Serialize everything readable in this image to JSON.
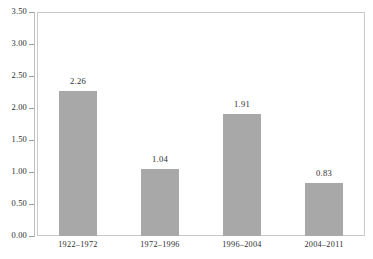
{
  "chart_data": {
    "type": "bar",
    "title": "",
    "subtitle": "",
    "xlabel": "",
    "ylabel": "",
    "categories": [
      "1922–1972",
      "1972–1996",
      "1996–2004",
      "2004–2011"
    ],
    "values": [
      2.26,
      1.04,
      1.91,
      0.83
    ],
    "value_labels": [
      "2.26",
      "1.04",
      "1.91",
      "0.83"
    ],
    "ylim": [
      0.0,
      3.5
    ],
    "ytick_labels": [
      "0.00",
      "0.50",
      "1.00",
      "1.50",
      "2.00",
      "2.50",
      "3.00",
      "3.50"
    ],
    "ytick_values": [
      0.0,
      0.5,
      1.0,
      1.5,
      2.0,
      2.5,
      3.0,
      3.5
    ],
    "grid": false,
    "legend": false,
    "legend_position": "none",
    "bar_color": "#a8a8a8",
    "frame_color": "#c9c9c9",
    "text_color": "#2e2e2e",
    "background": "#ffffff"
  }
}
